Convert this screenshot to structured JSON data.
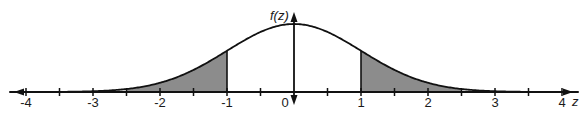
{
  "diagram": {
    "type": "normal-distribution",
    "y_axis_label": "f(z)",
    "x_axis_label": "z",
    "x_range": [
      -4,
      4
    ],
    "major_ticks": [
      -4,
      -3,
      -2,
      -1,
      0,
      1,
      2,
      3,
      4
    ],
    "minor_ticks": [
      -3.5,
      -2.5,
      -1.5,
      -0.5,
      0.5,
      1.5,
      2.5,
      3.5
    ],
    "tick_labels": [
      "-4",
      "-3",
      "-2",
      "-1",
      "0",
      "1",
      "2",
      "3",
      "4"
    ],
    "shaded_regions": [
      {
        "name": "left-tail",
        "from": -2.5,
        "to": -1
      },
      {
        "name": "right-tail",
        "from": 1,
        "to": 2.5
      }
    ],
    "colors": {
      "curve": "#111111",
      "axis": "#111111",
      "shade": "#8c8c8c",
      "background": "#ffffff"
    }
  },
  "layout": {
    "origin_x": 294,
    "axis_y": 92,
    "unit_px": 67,
    "peak_y": 24,
    "axis_left_x": 14,
    "axis_right_x": 573,
    "yaxis_top_y": 12,
    "yaxis_bottom_y": 105
  }
}
